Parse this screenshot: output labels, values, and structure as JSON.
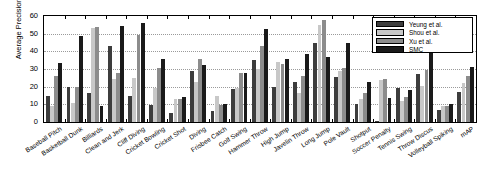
{
  "chart_data": {
    "type": "bar",
    "title": "",
    "xlabel": "",
    "ylabel": "Average Precision (%)",
    "ylim": [
      0,
      60
    ],
    "yticks": [
      0,
      10,
      20,
      30,
      40,
      50,
      60
    ],
    "grid": true,
    "legend_position": "top-right",
    "categories": [
      "Baseball Pitch",
      "Basketball Dunk",
      "Billiards",
      "Clean and Jerk",
      "Cliff Diving",
      "Cricket Bowling",
      "Cricket Shot",
      "Diving",
      "Frisbee Catch",
      "Golf Swing",
      "Hammer Throw",
      "High Jump",
      "Javelin Throw",
      "Long Jump",
      "Pole Vault",
      "Shotput",
      "Soccer Penalty",
      "Tennis Swing",
      "Throw Discus",
      "Volleyball Spiking",
      "mAP"
    ],
    "series": [
      {
        "name": "Yeung et al.",
        "color": "#3d3d3d",
        "values": [
          14.6,
          20.0,
          16.6,
          43.0,
          15.0,
          9.6,
          5.3,
          29.1,
          6.3,
          18.5,
          35.1,
          20.0,
          22.5,
          44.5,
          25.7,
          10.2,
          0.8,
          19.2,
          27.0,
          6.6,
          17.1
        ]
      },
      {
        "name": "Shou et al.",
        "color": "#c8c8c8",
        "values": [
          9.0,
          11.0,
          53.4,
          24.6,
          25.0,
          19.3,
          13.2,
          22.5,
          14.7,
          19.5,
          30.0,
          34.0,
          16.5,
          55.0,
          29.0,
          13.0,
          24.0,
          12.0,
          20.5,
          9.0,
          22.0
        ]
      },
      {
        "name": "Xu et al.",
        "color": "#8c8c8c",
        "values": [
          26.0,
          19.8,
          53.6,
          27.5,
          49.0,
          30.3,
          13.0,
          35.7,
          9.5,
          27.5,
          43.0,
          33.0,
          26.0,
          57.7,
          30.7,
          16.5,
          24.6,
          14.0,
          29.6,
          8.9,
          26.0
        ]
      },
      {
        "name": "SMC",
        "color": "#1a1a1a",
        "values": [
          33.6,
          48.7,
          9.0,
          54.3,
          56.2,
          35.5,
          14.0,
          32.3,
          10.2,
          28.0,
          52.5,
          35.5,
          38.6,
          37.0,
          45.0,
          22.5,
          13.5,
          18.2,
          41.8,
          10.3,
          31.0
        ]
      }
    ]
  },
  "legend": {
    "entries": [
      {
        "label": "Yeung et al."
      },
      {
        "label": "Shou et al."
      },
      {
        "label": "Xu et al."
      },
      {
        "label": "SMC"
      }
    ]
  }
}
